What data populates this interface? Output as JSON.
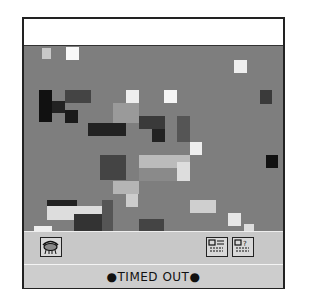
{
  "window": {
    "title": ""
  },
  "puzzle": {
    "background_color": "#7e7e7e",
    "description": "scrambled tile image of a face with hand",
    "tiles": [
      {
        "x": 18,
        "y": 2,
        "w": 9,
        "h": 11,
        "c": "#c8c8c8"
      },
      {
        "x": 42,
        "y": 1,
        "w": 13,
        "h": 13,
        "c": "#f8f8f8"
      },
      {
        "x": 210,
        "y": 14,
        "w": 13,
        "h": 13,
        "c": "#eeeeee"
      },
      {
        "x": 15,
        "y": 44,
        "w": 13,
        "h": 32,
        "c": "#111111"
      },
      {
        "x": 28,
        "y": 55,
        "w": 13,
        "h": 12,
        "c": "#222222"
      },
      {
        "x": 41,
        "y": 44,
        "w": 26,
        "h": 13,
        "c": "#444444"
      },
      {
        "x": 41,
        "y": 64,
        "w": 13,
        "h": 13,
        "c": "#1a1a1a"
      },
      {
        "x": 102,
        "y": 44,
        "w": 13,
        "h": 13,
        "c": "#eeeeee"
      },
      {
        "x": 140,
        "y": 44,
        "w": 13,
        "h": 13,
        "c": "#f5f5f5"
      },
      {
        "x": 236,
        "y": 44,
        "w": 12,
        "h": 14,
        "c": "#3a3a3a"
      },
      {
        "x": 89,
        "y": 57,
        "w": 26,
        "h": 20,
        "c": "#9a9a9a"
      },
      {
        "x": 115,
        "y": 70,
        "w": 26,
        "h": 13,
        "c": "#3a3a3a"
      },
      {
        "x": 64,
        "y": 77,
        "w": 38,
        "h": 13,
        "c": "#222222"
      },
      {
        "x": 128,
        "y": 83,
        "w": 13,
        "h": 13,
        "c": "#222222"
      },
      {
        "x": 153,
        "y": 70,
        "w": 13,
        "h": 26,
        "c": "#555555"
      },
      {
        "x": 166,
        "y": 96,
        "w": 12,
        "h": 13,
        "c": "#eeeeee"
      },
      {
        "x": 76,
        "y": 109,
        "w": 26,
        "h": 25,
        "c": "#444444"
      },
      {
        "x": 115,
        "y": 109,
        "w": 51,
        "h": 13,
        "c": "#bbbbbb"
      },
      {
        "x": 115,
        "y": 122,
        "w": 38,
        "h": 13,
        "c": "#8a8a8a"
      },
      {
        "x": 153,
        "y": 116,
        "w": 13,
        "h": 19,
        "c": "#dddddd"
      },
      {
        "x": 242,
        "y": 109,
        "w": 12,
        "h": 13,
        "c": "#111111"
      },
      {
        "x": 89,
        "y": 135,
        "w": 26,
        "h": 13,
        "c": "#b5b5b5"
      },
      {
        "x": 102,
        "y": 148,
        "w": 12,
        "h": 13,
        "c": "#cccccc"
      },
      {
        "x": 23,
        "y": 154,
        "w": 30,
        "h": 13,
        "c": "#222222"
      },
      {
        "x": 23,
        "y": 160,
        "w": 55,
        "h": 14,
        "c": "#dddddd"
      },
      {
        "x": 78,
        "y": 154,
        "w": 11,
        "h": 43,
        "c": "#555555"
      },
      {
        "x": 166,
        "y": 154,
        "w": 26,
        "h": 13,
        "c": "#cfcfcf"
      },
      {
        "x": 115,
        "y": 173,
        "w": 25,
        "h": 13,
        "c": "#444444"
      },
      {
        "x": 204,
        "y": 167,
        "w": 13,
        "h": 13,
        "c": "#e6e6e6"
      },
      {
        "x": 10,
        "y": 180,
        "w": 18,
        "h": 5,
        "c": "#eeeeee"
      },
      {
        "x": 50,
        "y": 168,
        "w": 28,
        "h": 17,
        "c": "#333333"
      },
      {
        "x": 220,
        "y": 178,
        "w": 10,
        "h": 7,
        "c": "#dddddd"
      }
    ]
  },
  "toolbar": {
    "left_button": {
      "icon": "eye-lens-icon",
      "label": "Show picture"
    },
    "right_buttons": [
      {
        "icon": "options-icon",
        "label": "Options"
      },
      {
        "icon": "help-icon",
        "label": "Help"
      }
    ]
  },
  "status": {
    "text": "●TIMED OUT●"
  }
}
